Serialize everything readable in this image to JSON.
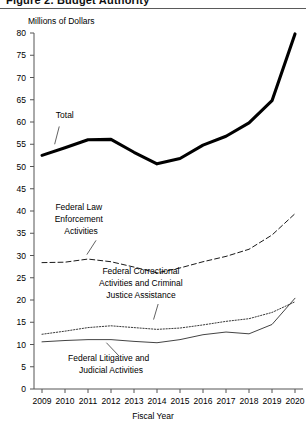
{
  "document": {
    "cut_title": "Figure 2.  Budget Authority"
  },
  "chart_data": {
    "type": "line",
    "title": "",
    "ylabel": "Millions of Dollars",
    "xlabel": "Fiscal Year",
    "categories": [
      "2009",
      "2010",
      "2011",
      "2012",
      "2013",
      "2014",
      "2015",
      "2016",
      "2017",
      "2018",
      "2019",
      "2020"
    ],
    "x": [
      2009,
      2010,
      2011,
      2012,
      2013,
      2014,
      2015,
      2016,
      2017,
      2018,
      2019,
      2020
    ],
    "ylim": [
      0,
      80
    ],
    "yticks": [
      0,
      5,
      10,
      15,
      20,
      25,
      30,
      35,
      40,
      45,
      50,
      55,
      60,
      65,
      70,
      75,
      80
    ],
    "xticks": [
      2009,
      2010,
      2011,
      2012,
      2013,
      2014,
      2015,
      2016,
      2017,
      2018,
      2019,
      2020
    ],
    "grid": false,
    "legend": "inline-annotations",
    "series": [
      {
        "name": "Total",
        "style": "solid-thick",
        "values": [
          52.5,
          54.2,
          56.0,
          56.1,
          53.2,
          50.6,
          51.8,
          54.8,
          56.8,
          59.8,
          64.8,
          79.8
        ]
      },
      {
        "name": "Federal Law Enforcement Activities",
        "style": "dashed",
        "values": [
          28.4,
          28.5,
          29.2,
          28.6,
          27.4,
          26.1,
          27.2,
          28.6,
          29.8,
          31.4,
          34.6,
          39.4
        ]
      },
      {
        "name": "Federal Correctional Activities and Criminal Justice Assistance",
        "style": "dotted",
        "values": [
          12.3,
          13.0,
          13.8,
          14.2,
          13.8,
          13.4,
          13.7,
          14.4,
          15.2,
          15.8,
          17.2,
          19.6
        ]
      },
      {
        "name": "Federal Litigative and Judicial Activities",
        "style": "solid-thin",
        "values": [
          10.6,
          10.9,
          11.1,
          11.1,
          10.7,
          10.4,
          11.1,
          12.2,
          12.8,
          12.4,
          14.5,
          20.4
        ]
      }
    ],
    "annotations": [
      {
        "text": "Total",
        "x": 2009.6,
        "y": 61.0
      },
      {
        "text": "Federal Law",
        "x": 2010.6,
        "y": 40.3
      },
      {
        "text": "Enforcement",
        "x": 2010.6,
        "y": 37.6
      },
      {
        "text": "Activities",
        "x": 2010.7,
        "y": 34.9
      },
      {
        "text": "Federal Correctional",
        "x": 2013.3,
        "y": 25.8
      },
      {
        "text": "Activities and Criminal",
        "x": 2013.3,
        "y": 23.1
      },
      {
        "text": "Justice Assistance",
        "x": 2013.3,
        "y": 20.4
      },
      {
        "text": "Federal Litigative and",
        "x": 2011.9,
        "y": 6.2
      },
      {
        "text": "Judicial Activities",
        "x": 2012.0,
        "y": 3.5
      }
    ],
    "colors": {
      "total": "#000000",
      "law_enforcement": "#1a1a1a",
      "correctional": "#3a3a3a",
      "litigative": "#444444",
      "axis": "#555555",
      "background": "#ffffff"
    }
  }
}
